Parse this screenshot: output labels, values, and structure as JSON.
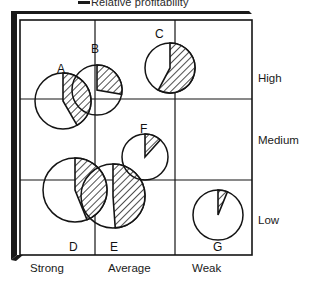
{
  "legend": {
    "marker": "line-swatch",
    "label": "Relative profitability"
  },
  "axes": {
    "y": {
      "name": "Relative profitability level",
      "ticks": [
        {
          "label": "High",
          "top": 72
        },
        {
          "label": "Medium",
          "top": 134
        },
        {
          "label": "Low",
          "top": 214
        }
      ]
    },
    "x": {
      "name": "Competitive position",
      "ticks": [
        {
          "label": "Strong",
          "left": 30
        },
        {
          "label": "Average",
          "left": 108
        },
        {
          "label": "Weak",
          "left": 192
        }
      ]
    }
  },
  "chart_data": {
    "type": "pie",
    "title": "Relative profitability",
    "xlabel": "",
    "ylabel": "",
    "grid": true,
    "legend_position": "top",
    "x_categories": [
      "Strong",
      "Average",
      "Weak"
    ],
    "y_categories": [
      "High",
      "Medium",
      "Low"
    ],
    "xlim": [
      0,
      3
    ],
    "ylim": [
      0,
      3
    ],
    "points": [
      {
        "label": "A",
        "x_category": "Strong",
        "y_category": "High",
        "cx": 63,
        "cy": 101,
        "r": 28,
        "share_deg": 150,
        "share_pct": 42,
        "label_x": 57,
        "label_y": 62
      },
      {
        "label": "B",
        "x_category": "Strong",
        "y_category": "High",
        "cx": 97,
        "cy": 90,
        "r": 25,
        "share_deg": 100,
        "share_pct": 28,
        "label_x": 91,
        "label_y": 42
      },
      {
        "label": "C",
        "x_category": "Average",
        "y_category": "High",
        "cx": 170,
        "cy": 68,
        "r": 25,
        "share_deg": 208,
        "share_pct": 58,
        "label_x": 155,
        "label_y": 27
      },
      {
        "label": "D",
        "x_category": "Strong",
        "y_category": "Low",
        "cx": 75,
        "cy": 190,
        "r": 32,
        "share_deg": 158,
        "share_pct": 44,
        "label_x": 69,
        "label_y": 240
      },
      {
        "label": "E",
        "x_category": "Average",
        "y_category": "Low",
        "cx": 113,
        "cy": 196,
        "r": 32,
        "share_deg": 176,
        "share_pct": 49,
        "label_x": 110,
        "label_y": 240
      },
      {
        "label": "F",
        "x_category": "Average",
        "y_category": "Medium",
        "cx": 145,
        "cy": 157,
        "r": 23,
        "share_deg": 42,
        "share_pct": 12,
        "label_x": 140,
        "label_y": 122
      },
      {
        "label": "G",
        "x_category": "Weak",
        "y_category": "Low",
        "cx": 218,
        "cy": 215,
        "r": 25,
        "share_deg": 22,
        "share_pct": 6,
        "label_x": 213,
        "label_y": 240
      }
    ],
    "plot_frame": {
      "left": 20,
      "top": 20,
      "right": 252,
      "bottom": 255
    },
    "gridlines": {
      "vertical": [
        95,
        175
      ],
      "horizontal": [
        99,
        180
      ]
    },
    "colors": {
      "line": "#141414",
      "hatch": "#141414",
      "fill": "#ffffff",
      "shadow": "#1a1a1a",
      "text": "#1a1a1a"
    }
  }
}
